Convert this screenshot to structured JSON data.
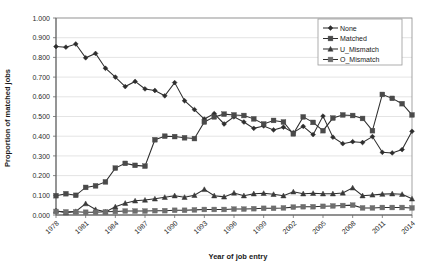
{
  "chart_data": {
    "type": "line",
    "title": "",
    "xlabel": "Year of job entry",
    "ylabel": "Proportion of matched jobs",
    "xlim": [
      1978,
      2014
    ],
    "ylim": [
      0.0,
      1.0
    ],
    "grid": true,
    "legend_position": "top-right",
    "y_ticks": [
      "0.000",
      "0.100",
      "0.200",
      "0.300",
      "0.400",
      "0.500",
      "0.600",
      "0.700",
      "0.800",
      "0.900",
      "1.000"
    ],
    "y_tick_values": [
      0.0,
      0.1,
      0.2,
      0.3,
      0.4,
      0.5,
      0.6,
      0.7,
      0.8,
      0.9,
      1.0
    ],
    "x_ticks": [
      "1978",
      "1981",
      "1984",
      "1987",
      "1990",
      "1993",
      "1996",
      "1999",
      "2002",
      "2005",
      "2008",
      "2011",
      "2014"
    ],
    "x_tick_values": [
      1978,
      1981,
      1984,
      1987,
      1990,
      1993,
      1996,
      1999,
      2002,
      2005,
      2008,
      2011,
      2014
    ],
    "x": [
      1978,
      1979,
      1980,
      1981,
      1982,
      1983,
      1984,
      1985,
      1986,
      1987,
      1988,
      1989,
      1990,
      1991,
      1992,
      1993,
      1994,
      1995,
      1996,
      1997,
      1998,
      1999,
      2000,
      2001,
      2002,
      2003,
      2004,
      2005,
      2006,
      2007,
      2008,
      2009,
      2010,
      2011,
      2012,
      2013,
      2014
    ],
    "series": [
      {
        "name": "None",
        "marker": "diamond",
        "color": "#2d2d2d",
        "values": [
          0.855,
          0.852,
          0.868,
          0.798,
          0.82,
          0.745,
          0.7,
          0.652,
          0.678,
          0.64,
          0.632,
          0.605,
          0.672,
          0.58,
          0.535,
          0.487,
          0.515,
          0.462,
          0.498,
          0.472,
          0.44,
          0.452,
          0.432,
          0.446,
          0.418,
          0.45,
          0.408,
          0.502,
          0.395,
          0.362,
          0.372,
          0.368,
          0.398,
          0.318,
          0.315,
          0.332,
          0.425
        ]
      },
      {
        "name": "Matched",
        "marker": "square",
        "color": "#4a4a4a",
        "values": [
          0.098,
          0.108,
          0.1,
          0.14,
          0.148,
          0.168,
          0.238,
          0.262,
          0.252,
          0.248,
          0.382,
          0.4,
          0.398,
          0.392,
          0.388,
          0.472,
          0.498,
          0.512,
          0.508,
          0.505,
          0.488,
          0.462,
          0.48,
          0.472,
          0.412,
          0.498,
          0.47,
          0.428,
          0.492,
          0.508,
          0.505,
          0.49,
          0.428,
          0.612,
          0.592,
          0.565,
          0.508
        ]
      },
      {
        "name": "U_Mismatch",
        "marker": "triangle",
        "color": "#3a3a3a",
        "values": [
          0.022,
          0.012,
          0.018,
          0.058,
          0.028,
          0.016,
          0.042,
          0.06,
          0.072,
          0.076,
          0.082,
          0.09,
          0.098,
          0.09,
          0.1,
          0.13,
          0.098,
          0.092,
          0.112,
          0.098,
          0.108,
          0.11,
          0.105,
          0.098,
          0.118,
          0.108,
          0.11,
          0.108,
          0.108,
          0.112,
          0.138,
          0.098,
          0.102,
          0.106,
          0.108,
          0.105,
          0.082
        ]
      },
      {
        "name": "O_Mismatch",
        "marker": "square",
        "color": "#6e6e6e",
        "values": [
          0.018,
          0.016,
          0.016,
          0.014,
          0.014,
          0.016,
          0.018,
          0.02,
          0.02,
          0.02,
          0.022,
          0.022,
          0.024,
          0.024,
          0.026,
          0.028,
          0.028,
          0.028,
          0.03,
          0.03,
          0.032,
          0.034,
          0.034,
          0.036,
          0.04,
          0.042,
          0.042,
          0.044,
          0.046,
          0.048,
          0.05,
          0.036,
          0.036,
          0.038,
          0.038,
          0.038,
          0.036
        ]
      }
    ]
  },
  "legend": {
    "items": [
      {
        "label": "None"
      },
      {
        "label": "Matched"
      },
      {
        "label": "U_Mismatch"
      },
      {
        "label": "O_Mismatch"
      }
    ]
  }
}
